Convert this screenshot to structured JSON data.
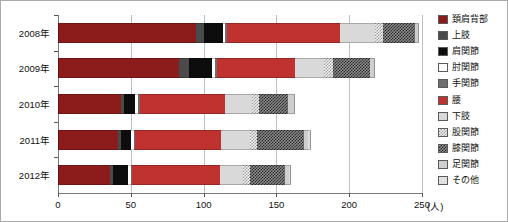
{
  "chart_data": {
    "type": "bar",
    "orientation": "horizontal",
    "stacked": true,
    "title": "",
    "xlabel": "(人)",
    "ylabel": "",
    "xlim": [
      0,
      250
    ],
    "xticks": [
      0,
      50,
      100,
      150,
      200,
      250
    ],
    "xtick_labels": [
      "0",
      "50",
      "100",
      "150",
      "200",
      "250"
    ],
    "unit_label": "(人)",
    "grid": true,
    "grid_axis": "x",
    "legend_position": "right",
    "categories": [
      "2008年",
      "2009年",
      "2010年",
      "2011年",
      "2012年"
    ],
    "series": [
      {
        "name": "頚肩背部",
        "color": "#8c1c1c",
        "pattern": "solid",
        "values": [
          95,
          83,
          43,
          41,
          36
        ]
      },
      {
        "name": "上肢",
        "color": "#4a4a4a",
        "pattern": "solid",
        "values": [
          5,
          7,
          2,
          2,
          2
        ]
      },
      {
        "name": "肩関節",
        "color": "#0d0d0d",
        "pattern": "solid",
        "values": [
          13,
          16,
          8,
          7,
          10
        ]
      },
      {
        "name": "肘関節",
        "color": "#ffffff",
        "pattern": "solid",
        "values": [
          2,
          2,
          2,
          2,
          2
        ]
      },
      {
        "name": "手関節",
        "color": "#6e6e6e",
        "pattern": "solid",
        "values": [
          1,
          1,
          1,
          1,
          1
        ]
      },
      {
        "name": "腰",
        "color": "#c0322f",
        "pattern": "solid",
        "values": [
          78,
          54,
          59,
          59,
          60
        ]
      },
      {
        "name": "下肢",
        "color": "#d9d9d9",
        "pattern": "solid",
        "values": [
          24,
          20,
          18,
          20,
          16
        ]
      },
      {
        "name": "股関節",
        "color": "#f2f2f2",
        "pattern": "checker-light",
        "values": [
          5,
          6,
          5,
          5,
          5
        ]
      },
      {
        "name": "膝関節",
        "color": "#8a8a8a",
        "pattern": "checker-dark",
        "values": [
          22,
          25,
          20,
          32,
          24
        ]
      },
      {
        "name": "足関節",
        "color": "#cfcfcf",
        "pattern": "solid",
        "values": [
          2,
          3,
          4,
          3,
          3
        ]
      },
      {
        "name": "その他",
        "color": "#e0e0e0",
        "pattern": "solid",
        "values": [
          1,
          1,
          1,
          2,
          1
        ]
      }
    ],
    "totals": [
      248,
      218,
      163,
      174,
      160
    ]
  }
}
